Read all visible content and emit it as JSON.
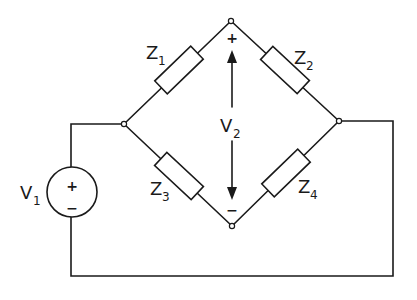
{
  "diagram": {
    "type": "circuit",
    "source": {
      "label": "V",
      "subscript": "1",
      "plus": "+",
      "minus": "−"
    },
    "output": {
      "label": "V",
      "subscript": "2",
      "plus": "+",
      "minus": "−"
    },
    "impedances": [
      {
        "label": "Z",
        "subscript": "1",
        "branch": "left-node to top-node"
      },
      {
        "label": "Z",
        "subscript": "2",
        "branch": "top-node to right-node"
      },
      {
        "label": "Z",
        "subscript": "3",
        "branch": "left-node to bottom-node"
      },
      {
        "label": "Z",
        "subscript": "4",
        "branch": "bottom-node to right-node"
      }
    ],
    "colors": {
      "line": "#1a1a1a",
      "background": "#ffffff"
    }
  }
}
